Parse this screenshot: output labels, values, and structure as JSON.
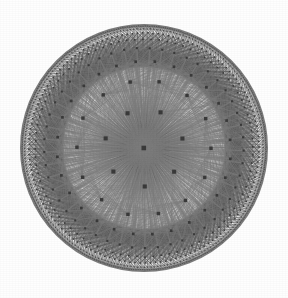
{
  "figure": {
    "caption": ""
  },
  "canvas": {
    "width": 288,
    "height": 298,
    "background_color": "#fefefe"
  },
  "chart_data": {
    "type": "diagram",
    "subtype": "poincare-disk-graph",
    "disk": {
      "center_x": 144,
      "center_y": 148,
      "radius": 124,
      "boundary_visible": true,
      "boundary_color": "#4a4a4a"
    },
    "tiling": {
      "schlafli_p": 3,
      "schlafli_q": 7,
      "vertex_degree": 14,
      "branching": 7,
      "rings": 8,
      "description": "Order-7 triangular tiling; each hub vertex has 7 hub neighbours and 14 incident geodesic edges"
    },
    "rings": [
      {
        "index": 0,
        "nodes": 1,
        "radius_fraction": 0.0,
        "node_size": 4.6
      },
      {
        "index": 1,
        "nodes": 7,
        "radius_fraction": 0.315,
        "node_size": 4.1
      },
      {
        "index": 2,
        "nodes": 14,
        "radius_fraction": 0.545,
        "node_size": 3.4
      },
      {
        "index": 3,
        "nodes": 28,
        "radius_fraction": 0.7,
        "node_size": 2.7
      },
      {
        "index": 4,
        "nodes": 49,
        "radius_fraction": 0.805,
        "node_size": 2.1
      },
      {
        "index": 5,
        "nodes": 84,
        "radius_fraction": 0.878,
        "node_size": 1.6
      },
      {
        "index": 6,
        "nodes": 140,
        "radius_fraction": 0.928,
        "node_size": 1.2
      },
      {
        "index": 7,
        "nodes": 224,
        "radius_fraction": 0.962,
        "node_size": 0.9
      },
      {
        "index": 8,
        "nodes": 340,
        "radius_fraction": 0.984,
        "node_size": 0.7
      }
    ],
    "node_style": {
      "shape": "square",
      "color": "#3a3a3a",
      "min_size": 0.7,
      "max_size": 4.6
    },
    "edge_style": {
      "geodesic": true,
      "color": "#7c7c7c",
      "color_outer": "#5a5a5a",
      "width_inner": 0.55,
      "width_outer": 0.28,
      "opacity": 0.85
    },
    "counts": {
      "total_nodes": 887,
      "approx_edges": 2400
    },
    "xlabel": "",
    "ylabel": "",
    "legend": [],
    "grid": false
  }
}
